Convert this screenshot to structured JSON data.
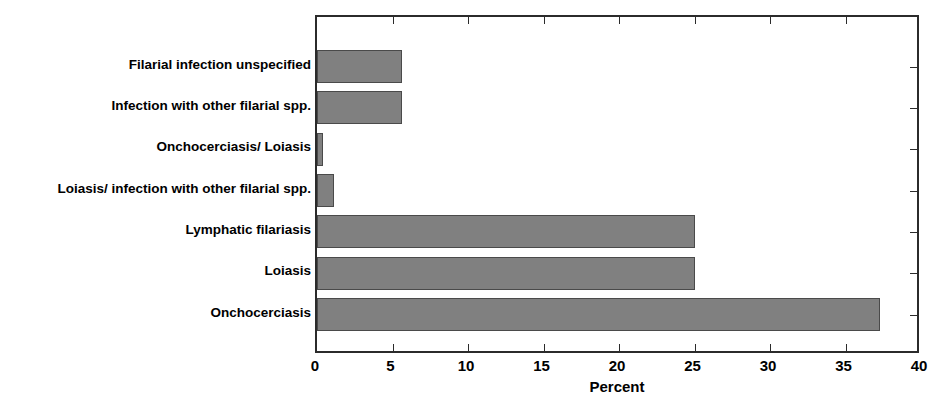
{
  "chart_data": {
    "type": "bar",
    "orientation": "horizontal",
    "title": "",
    "xlabel": "Percent",
    "ylabel": "",
    "xlim": [
      0,
      40
    ],
    "xticks": [
      0,
      5,
      10,
      15,
      20,
      25,
      30,
      35,
      40
    ],
    "xtick_labels": [
      "0",
      "5",
      "10",
      "15",
      "20",
      "25",
      "30",
      "35",
      "40"
    ],
    "grid": false,
    "legend": false,
    "bar_color": "#808080",
    "bar_edge_color": "#4a4a4a",
    "frame_color": "#2b2b2b",
    "categories": [
      "Filarial infection unspecified",
      "Infection with other filarial spp.",
      "Onchocerciasis/ Loiasis",
      "Loiasis/ infection with other filarial spp.",
      "Lymphatic filariasis",
      "Loiasis",
      "Onchocerciasis"
    ],
    "values": [
      5.6,
      5.6,
      0.4,
      1.1,
      25.0,
      25.0,
      37.3
    ],
    "bars": [
      {
        "label": "Filarial infection unspecified",
        "value": 5.6
      },
      {
        "label": "Infection with other filarial spp.",
        "value": 5.6
      },
      {
        "label": "Onchocerciasis/ Loiasis",
        "value": 0.4
      },
      {
        "label": "Loiasis/ infection with other filarial spp.",
        "value": 1.1
      },
      {
        "label": "Lymphatic filariasis",
        "value": 25.0
      },
      {
        "label": "Loiasis",
        "value": 25.0
      },
      {
        "label": "Onchocerciasis",
        "value": 37.3
      }
    ]
  }
}
